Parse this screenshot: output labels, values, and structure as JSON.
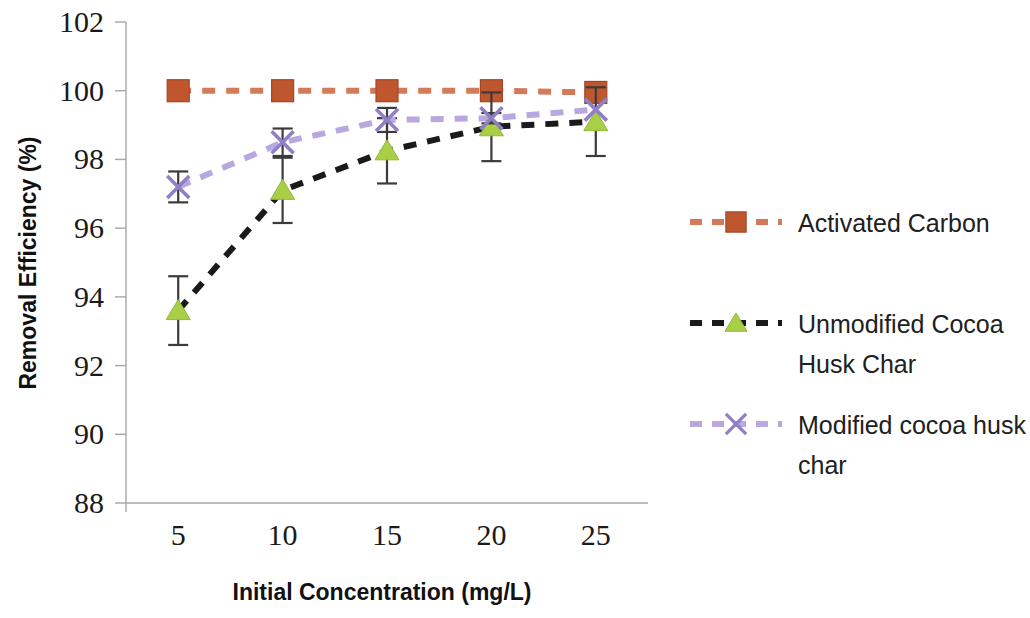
{
  "chart_data": {
    "type": "line",
    "title": "",
    "xlabel": "Initial Concentration (mg/L)",
    "ylabel": "Removal Efficiency (%)",
    "categories": [
      "5",
      "10",
      "15",
      "20",
      "25"
    ],
    "x": [
      5,
      10,
      15,
      20,
      25
    ],
    "xlim": [
      2.5,
      27.5
    ],
    "ylim": [
      88,
      102
    ],
    "ytick_labels": [
      "88",
      "90",
      "92",
      "94",
      "96",
      "98",
      "100",
      "102"
    ],
    "yticks": [
      88,
      90,
      92,
      94,
      96,
      98,
      100,
      102
    ],
    "xtick_labels": [
      "5",
      "10",
      "15",
      "20",
      "25"
    ],
    "grid": false,
    "legend_position": "right",
    "series": [
      {
        "name": "Activated Carbon",
        "color": "#c0562e",
        "line_color": "#d4795a",
        "marker": "square",
        "linestyle": "dashed",
        "values": [
          100.0,
          100.0,
          100.0,
          100.0,
          99.95
        ],
        "errors": [
          0,
          0,
          0,
          0,
          0
        ]
      },
      {
        "name": "Unmodified Cocoa Husk Char",
        "color": "#a8cf45",
        "line_color": "#1a1a1a",
        "marker": "triangle",
        "linestyle": "dashed",
        "values": [
          93.6,
          97.1,
          98.25,
          98.95,
          99.1
        ],
        "errors": [
          1.0,
          0.95,
          0.95,
          1.0,
          1.0
        ]
      },
      {
        "name": "Modified cocoa husk char",
        "color": "#8f7fc4",
        "line_color": "#b9a8e0",
        "marker": "cross",
        "linestyle": "dashed",
        "values": [
          97.2,
          98.5,
          99.15,
          99.2,
          99.45
        ],
        "errors": [
          0.45,
          0.4,
          0.35,
          0.15,
          0.0
        ]
      }
    ]
  },
  "legend": {
    "entries": [
      {
        "label": "Activated Carbon",
        "lines": [
          "Activated Carbon"
        ]
      },
      {
        "label": "Unmodified Cocoa Husk Char",
        "lines": [
          "Unmodified Cocoa",
          "Husk Char"
        ]
      },
      {
        "label": "Modified cocoa husk char",
        "lines": [
          "Modified cocoa husk",
          "char"
        ]
      }
    ]
  },
  "axes": {
    "y_title": "Removal Efficiency (%)",
    "x_title": "Initial Concentration (mg/L)"
  }
}
